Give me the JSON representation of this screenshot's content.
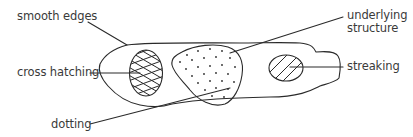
{
  "diagram": {
    "labels": {
      "smooth_edges": "smooth edges",
      "cross_hatching": "cross hatching",
      "dotting": "dotting",
      "underlying_line1": "underlying",
      "underlying_line2": "structure",
      "streaking": "streaking"
    },
    "colors": {
      "stroke": "#2a2a2a",
      "text": "#3a3a3a",
      "background": "#ffffff"
    }
  }
}
